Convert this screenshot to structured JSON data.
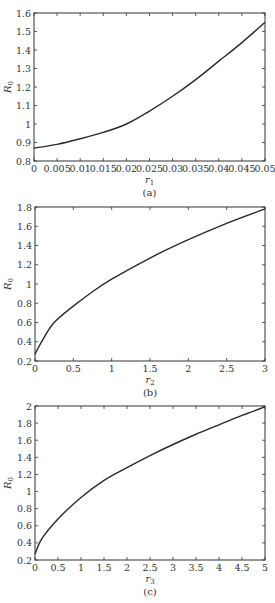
{
  "chart_data": [
    {
      "type": "line",
      "caption": "(a)",
      "title": "",
      "xlabel": "r1",
      "ylabel": "R0",
      "xlim": [
        0,
        0.05
      ],
      "ylim": [
        0.8,
        1.6
      ],
      "xticks": [
        "0",
        "0.005",
        "0.01",
        "0.015",
        "0.02",
        "0.025",
        "0.03",
        "0.035",
        "0.04",
        "0.045",
        "0.05"
      ],
      "yticks": [
        "0.8",
        "0.9",
        "1",
        "1.1",
        "1.2",
        "1.3",
        "1.4",
        "1.5",
        "1.6"
      ],
      "grid": false,
      "x": [
        0,
        0.005,
        0.01,
        0.015,
        0.02,
        0.025,
        0.03,
        0.035,
        0.04,
        0.045,
        0.05
      ],
      "series": [
        {
          "name": "R0",
          "values": [
            0.87,
            0.89,
            0.92,
            0.955,
            1.0,
            1.07,
            1.15,
            1.24,
            1.34,
            1.44,
            1.55
          ]
        }
      ]
    },
    {
      "type": "line",
      "caption": "(b)",
      "title": "",
      "xlabel": "r2",
      "ylabel": "R0",
      "xlim": [
        0,
        3
      ],
      "ylim": [
        0.2,
        1.8
      ],
      "xticks": [
        "0",
        "0.5",
        "1",
        "1.5",
        "2",
        "2.5",
        "3"
      ],
      "yticks": [
        "0.2",
        "0.4",
        "0.6",
        "0.8",
        "1",
        "1.2",
        "1.4",
        "1.6",
        "1.8"
      ],
      "grid": false,
      "x": [
        0,
        0.1,
        0.25,
        0.5,
        0.75,
        1,
        1.5,
        2,
        2.5,
        3
      ],
      "series": [
        {
          "name": "R0",
          "values": [
            0.27,
            0.42,
            0.6,
            0.77,
            0.92,
            1.05,
            1.27,
            1.46,
            1.63,
            1.78
          ]
        }
      ]
    },
    {
      "type": "line",
      "caption": "(c)",
      "title": "",
      "xlabel": "r3",
      "ylabel": "R0",
      "xlim": [
        0,
        5
      ],
      "ylim": [
        0.2,
        2.0
      ],
      "xticks": [
        "0",
        "0.5",
        "1",
        "1.5",
        "2",
        "2.5",
        "3",
        "3.5",
        "4",
        "4.5",
        "5"
      ],
      "yticks": [
        "0.2",
        "0.4",
        "0.6",
        "0.8",
        "1",
        "1.2",
        "1.4",
        "1.6",
        "1.8",
        "2"
      ],
      "grid": false,
      "x": [
        0,
        0.15,
        0.5,
        1,
        1.5,
        2,
        2.5,
        3,
        3.5,
        4,
        4.5,
        5
      ],
      "series": [
        {
          "name": "R0",
          "values": [
            0.27,
            0.45,
            0.68,
            0.93,
            1.13,
            1.28,
            1.42,
            1.55,
            1.67,
            1.78,
            1.89,
            1.99
          ]
        }
      ]
    }
  ],
  "colors": {
    "line": "#2a2a2a",
    "axis": "#333333"
  }
}
